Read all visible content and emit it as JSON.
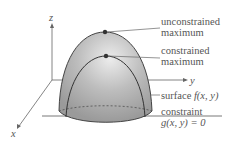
{
  "axes": {
    "x": "x",
    "y": "y",
    "z": "z"
  },
  "labels": {
    "unconstrained_line1": "unconstrained",
    "unconstrained_line2": "maximum",
    "constrained_line1": "constrained",
    "constrained_line2": "maximum",
    "surface_prefix": "surface ",
    "surface_func": "f(x, y)",
    "constraint_line1": "constraint",
    "constraint_line2": "g(x, y) = 0"
  },
  "colors": {
    "surface": "#a9a9a9",
    "highlight": "#e6e6e6",
    "outline": "#444444",
    "text": "#555555"
  }
}
